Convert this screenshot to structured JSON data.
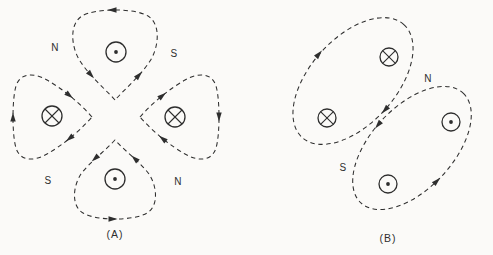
{
  "figure": {
    "background": "#fbfaf8",
    "ink_color": "#2e2e2e",
    "diagram_a": {
      "caption": "(A)",
      "pole_labels": {
        "top_left": "N",
        "top_right": "S",
        "bottom_left": "S",
        "bottom_right": "N"
      },
      "conductors": [
        {
          "position": "top",
          "current": "out-of-page",
          "glyph": "dot-in-circle"
        },
        {
          "position": "left",
          "current": "into-page",
          "glyph": "cross-in-circle"
        },
        {
          "position": "right",
          "current": "into-page",
          "glyph": "cross-in-circle"
        },
        {
          "position": "bottom",
          "current": "out-of-page",
          "glyph": "dot-in-circle"
        }
      ],
      "flux_pattern": "four dashed flux loops, one per conductor; flux enters center gap from N gaps, exits toward S gaps"
    },
    "diagram_b": {
      "caption": "(B)",
      "pole_labels": {
        "gap_upper": "N",
        "gap_lower": "S"
      },
      "conductors": [
        {
          "position": "upper-loop-top",
          "current": "into-page",
          "glyph": "cross-in-circle"
        },
        {
          "position": "upper-loop-bottom",
          "current": "into-page",
          "glyph": "cross-in-circle"
        },
        {
          "position": "lower-loop-top",
          "current": "out-of-page",
          "glyph": "dot-in-circle"
        },
        {
          "position": "lower-loop-bottom",
          "current": "out-of-page",
          "glyph": "dot-in-circle"
        }
      ],
      "flux_pattern": "two tilted dashed flux loops each enclosing two conductors; clockwise around cross pair, counterclockwise around dot pair"
    }
  }
}
